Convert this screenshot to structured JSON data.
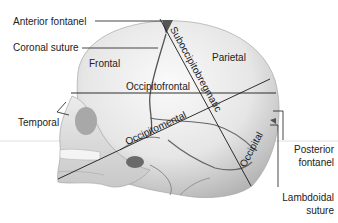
{
  "figure": {
    "labels_left": {
      "anterior_fontanel": "Anterior fontanel",
      "coronal_suture": "Coronal suture",
      "temporal": "Temporal"
    },
    "labels_right": {
      "posterior_fontanel_line1": "Posterior",
      "posterior_fontanel_line2": "fontanel",
      "lambdoidal_suture_line1": "Lambdoidal",
      "lambdoidal_suture_line2": "suture"
    },
    "bones": {
      "frontal": "Frontal",
      "parietal": "Parietal",
      "occipital": "Occipital"
    },
    "diameters": {
      "suboccipitobregmatic": "Suboccipitobregmatic",
      "occipitofrontal": "Occipitofrontal",
      "occipitomental": "Occipitomental"
    },
    "colors": {
      "skull_light": "#f2f2f2",
      "skull_shade": "#bdbdbd",
      "suture": "#4a4a4a",
      "line": "#1a1a1a"
    }
  }
}
